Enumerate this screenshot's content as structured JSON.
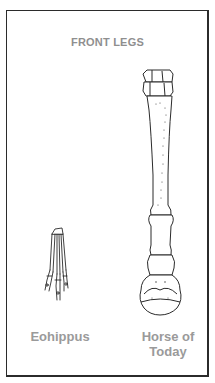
{
  "diagram": {
    "title": "FRONT LEGS",
    "specimens": [
      {
        "id": "eohippus",
        "label": "Eohippus"
      },
      {
        "id": "modern-horse",
        "label_line1": "Horse of",
        "label_line2": "Today"
      }
    ],
    "colors": {
      "ink": "#2b2b2b",
      "label_text": "#9a9a9a",
      "background": "#ffffff"
    }
  }
}
